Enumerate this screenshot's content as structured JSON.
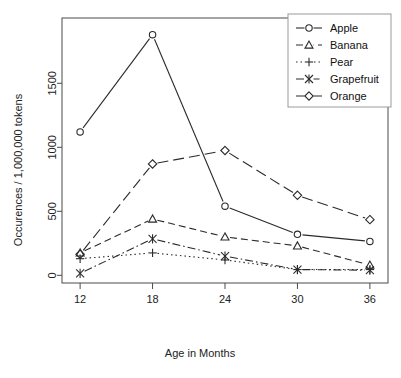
{
  "chart_data": {
    "type": "line",
    "title": "",
    "xlabel": "Age in Months",
    "ylabel": "Occurences / 1,000,000 tokens",
    "x": [
      12,
      18,
      24,
      30,
      36
    ],
    "xtick_labels": [
      "12",
      "18",
      "24",
      "30",
      "36"
    ],
    "ytick_labels": [
      "0",
      "500",
      "1000",
      "1500"
    ],
    "yticks": [
      0,
      500,
      1000,
      1500
    ],
    "xlim": [
      10.5,
      37.5
    ],
    "ylim": [
      -60,
      2010
    ],
    "grid": false,
    "legend_position": "top-right",
    "series": [
      {
        "name": "Apple",
        "marker": "circle",
        "linestyle": "solid",
        "values": [
          1120,
          1880,
          540,
          320,
          265
        ]
      },
      {
        "name": "Banana",
        "marker": "triangle",
        "linestyle": "dashed",
        "values": [
          175,
          440,
          300,
          230,
          80
        ]
      },
      {
        "name": "Pear",
        "marker": "plus",
        "linestyle": "dotted",
        "values": [
          130,
          175,
          120,
          45,
          45
        ]
      },
      {
        "name": "Grapefruit",
        "marker": "asterisk",
        "linestyle": "dashdot",
        "values": [
          15,
          285,
          150,
          45,
          40
        ]
      },
      {
        "name": "Orange",
        "marker": "diamond",
        "linestyle": "longdash",
        "values": [
          165,
          870,
          975,
          625,
          435
        ]
      }
    ]
  },
  "axes": {
    "x_title": "Age in Months",
    "y_title": "Occurences / 1,000,000 tokens"
  },
  "legend": {
    "entries": [
      {
        "label": "Apple"
      },
      {
        "label": "Banana"
      },
      {
        "label": "Pear"
      },
      {
        "label": "Grapefruit"
      },
      {
        "label": "Orange"
      }
    ]
  },
  "colors": {
    "line": "#2b2b2b",
    "axis": "#4a4a4a",
    "text": "#1a1a1a",
    "background": "#ffffff"
  }
}
